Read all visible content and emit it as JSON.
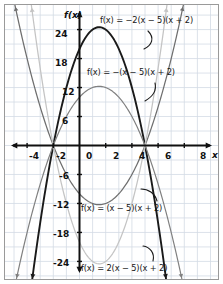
{
  "figure": {
    "kind": "coordinate-grid-graph",
    "border_color": "#9a9a9a",
    "grid_color": "#d3dbe4",
    "axis_color": "#101010",
    "background": "#ffffff"
  },
  "axes": {
    "x_axis_name": "x",
    "y_axis_name": "f(x)",
    "x_ticks": [
      "-4",
      "-2",
      "0",
      "2",
      "4",
      "6",
      "8"
    ],
    "x_tick_values": [
      -4,
      -2,
      0,
      2,
      4,
      6,
      8
    ],
    "y_ticks": [
      "24",
      "18",
      "12",
      "6",
      "-6",
      "-12",
      "-18",
      "-24"
    ],
    "y_tick_values": [
      24,
      18,
      12,
      6,
      -6,
      -12,
      -18,
      -24
    ],
    "xlim": [
      -6,
      9
    ],
    "ylim": [
      -30,
      30
    ],
    "grid": true
  },
  "chart_data": {
    "type": "line",
    "title": "",
    "xlabel": "x",
    "ylabel": "f(x)",
    "xlim": [
      -6,
      9
    ],
    "ylim": [
      -30,
      30
    ],
    "grid": true,
    "x_ticks": [
      -4,
      -2,
      0,
      2,
      4,
      6,
      8
    ],
    "y_ticks": [
      24,
      18,
      12,
      6,
      -6,
      -12,
      -18,
      -24
    ],
    "legend_position": "inline-annotations",
    "shared_roots": [
      -2,
      5
    ],
    "series": [
      {
        "name": "f(x) = -2(x - 5)(x + 2)",
        "label": "f(x) = −2(x − 5)(x + 2)",
        "leading_coefficient": -2,
        "color": "#1a1a1a",
        "vertex": [
          1.5,
          24.5
        ],
        "y_intercept": 20,
        "opens": "down",
        "x": [
          -2,
          -1,
          0,
          1,
          1.5,
          2,
          3,
          4,
          5
        ],
        "values": [
          0,
          12,
          20,
          24,
          24.5,
          24,
          20,
          12,
          0
        ]
      },
      {
        "name": "f(x) = -(x - 5)(x + 2)",
        "label": "f(x) = −(x − 5)(x + 2)",
        "leading_coefficient": -1,
        "color": "#808080",
        "vertex": [
          1.5,
          12.25
        ],
        "y_intercept": 10,
        "opens": "down",
        "x": [
          -2,
          -1,
          0,
          1,
          1.5,
          2,
          3,
          4,
          5
        ],
        "values": [
          0,
          6,
          10,
          12,
          12.25,
          12,
          10,
          6,
          0
        ]
      },
      {
        "name": "f(x) = (x - 5)(x + 2)",
        "label": "f(x) = (x − 5)(x + 2)",
        "leading_coefficient": 1,
        "color": "#6e6e6e",
        "vertex": [
          1.5,
          -12.25
        ],
        "y_intercept": -10,
        "opens": "up",
        "x": [
          -2,
          -1,
          0,
          1,
          1.5,
          2,
          3,
          4,
          5
        ],
        "values": [
          0,
          -6,
          -10,
          -12,
          -12.25,
          -12,
          -10,
          -6,
          0
        ]
      },
      {
        "name": "f(x) = 2(x - 5)(x + 2)",
        "label": "f(x) = 2(x − 5)(x + 2)",
        "leading_coefficient": 2,
        "color": "#c4c4c4",
        "vertex": [
          1.5,
          -24.5
        ],
        "y_intercept": -20,
        "opens": "up",
        "x": [
          -2,
          -1,
          0,
          1,
          1.5,
          2,
          3,
          4,
          5
        ],
        "values": [
          0,
          -12,
          -20,
          -24,
          -24.5,
          -24,
          -20,
          -12,
          0
        ]
      }
    ],
    "annotations": [
      {
        "text": "f(x) = −2(x − 5)(x + 2)",
        "points_to_series": "f(x) = -2(x - 5)(x + 2)"
      },
      {
        "text": "f(x) = −(x − 5)(x + 2)",
        "points_to_series": "f(x) = -(x - 5)(x + 2)"
      },
      {
        "text": "f(x) = (x − 5)(x + 2)",
        "points_to_series": "f(x) = (x - 5)(x + 2)"
      },
      {
        "text": "f(x) = 2(x − 5)(x + 2)",
        "points_to_series": "f(x) = 2(x - 5)(x + 2)"
      }
    ]
  },
  "labels": {
    "eq1": "f(x) = −2(x − 5)(x + 2)",
    "eq2": "f(x) = −(x − 5)(x + 2)",
    "eq3": "f(x) = (x − 5)(x + 2)",
    "eq4": "f(x) = 2(x − 5)(x + 2)",
    "x_neg4": "-4",
    "x_neg2": "-2",
    "x_0": "0",
    "x_2": "2",
    "x_4": "4",
    "x_6": "6",
    "x_8": "8",
    "x_axis_name": "x",
    "y_axis_name": "f(x)",
    "y_24": "24",
    "y_18": "18",
    "y_12": "12",
    "y_6": "6",
    "y_neg6": "-6",
    "y_neg12": "-12",
    "y_neg18": "-18",
    "y_neg24": "-24"
  }
}
